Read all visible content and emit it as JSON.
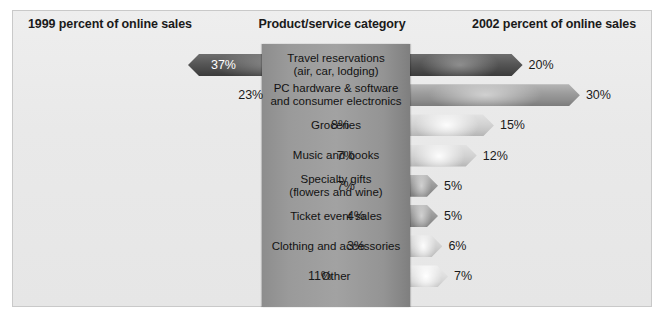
{
  "headers": {
    "left": "1999 percent of online sales",
    "center": "Product/service category",
    "right": "2002 percent of online sales"
  },
  "chart_data": {
    "type": "bar",
    "title": "Product/service category",
    "xlabel": "",
    "ylabel": "",
    "categories": [
      "Travel reservations (air, car, lodging)",
      "PC hardware & software and consumer electronics",
      "Groceries",
      "Music and books",
      "Specialty gifts (flowers and wine)",
      "Ticket event sales",
      "Clothing and accessories",
      "Other"
    ],
    "series": [
      {
        "name": "1999 percent of online sales",
        "values": [
          37,
          23,
          8,
          7,
          7,
          4,
          3,
          11
        ]
      },
      {
        "name": "2002 percent of online sales",
        "values": [
          20,
          30,
          15,
          12,
          5,
          5,
          6,
          7
        ]
      }
    ],
    "xlim": [
      0,
      40
    ],
    "grid": false,
    "legend": "none"
  },
  "rows": [
    {
      "label_line1": "Travel reservations",
      "label_line2": "(air, car, lodging)",
      "left_value": "37%",
      "right_value": "20%",
      "left_shade": "sh-dark",
      "right_shade": "sh-dark",
      "left_label_inside": true
    },
    {
      "label_line1": "PC hardware & software",
      "label_line2": "and consumer electronics",
      "left_value": "23%",
      "right_value": "30%",
      "left_shade": "sh-mid",
      "right_shade": "sh-mid",
      "left_label_inside": false
    },
    {
      "label_line1": "Groceries",
      "label_line2": "",
      "left_value": "8%",
      "right_value": "15%",
      "left_shade": "sh-light",
      "right_shade": "sh-light",
      "left_label_inside": false
    },
    {
      "label_line1": "Music and books",
      "label_line2": "",
      "left_value": "7%",
      "right_value": "12%",
      "left_shade": "sh-mid",
      "right_shade": "sh-light",
      "left_label_inside": false
    },
    {
      "label_line1": "Specialty gifts",
      "label_line2": "(flowers and wine)",
      "left_value": "7%",
      "right_value": "5%",
      "left_shade": "sh-mid",
      "right_shade": "sh-mid",
      "left_label_inside": false
    },
    {
      "label_line1": "Ticket event sales",
      "label_line2": "",
      "left_value": "4%",
      "right_value": "5%",
      "left_shade": "sh-dark",
      "right_shade": "sh-mid",
      "left_label_inside": false
    },
    {
      "label_line1": "Clothing and accessories",
      "label_line2": "",
      "left_value": "3%",
      "right_value": "6%",
      "left_shade": "sh-dark",
      "right_shade": "sh-light",
      "left_label_inside": false
    },
    {
      "label_line1": "Other",
      "label_line2": "",
      "left_value": "11%",
      "right_value": "7%",
      "left_shade": "sh-xlight",
      "right_shade": "sh-xlight",
      "left_label_inside": false
    }
  ],
  "colors": {
    "panel_background": "#e9e9e9",
    "center_slab": "#9a9a9a",
    "text": "#1a1a1a",
    "inside_label": "#ffffff"
  }
}
